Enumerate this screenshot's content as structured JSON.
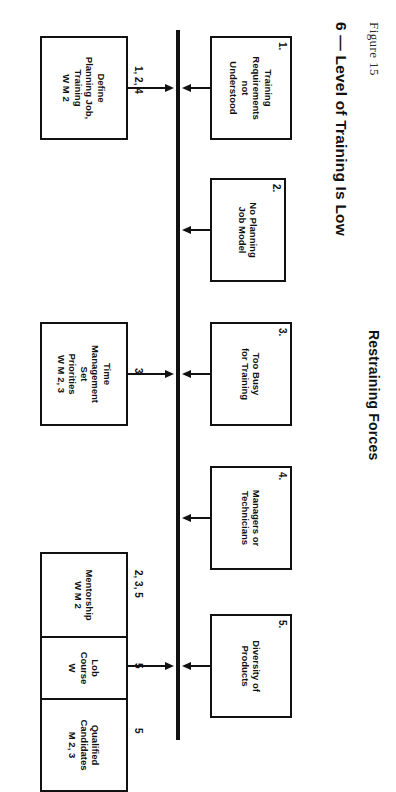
{
  "figure": {
    "label": "Figure 15",
    "section_title": "6 — Level of Training Is Low",
    "group_title": "Restraining Forces"
  },
  "center_line": {
    "color": "#111111"
  },
  "restraining_forces": [
    {
      "number": "1.",
      "text": "Training\nRequirements\nnot\nUnderstood"
    },
    {
      "number": "2.",
      "text": "No Planning\nJob Model"
    },
    {
      "number": "3.",
      "text": "Too Busy\nfor Training"
    },
    {
      "number": "4.",
      "text": "Managers or\nTechnicians"
    },
    {
      "number": "5.",
      "text": "Diversity of\nProducts"
    }
  ],
  "counter_measures": [
    {
      "tag": "1, 2, 4",
      "text": "Define\nPlanning Job,\nTraining\nW M 2"
    },
    {
      "tag": "3",
      "text": "Time\nManagement\nSet\nPriorities\nW M 2, 3"
    },
    {
      "tag": "2, 3, 5",
      "text": "Mentorship\nW M 2"
    },
    {
      "tag": "5",
      "text": "Lob\nCourse\nW"
    },
    {
      "tag": "5",
      "text": "Qualified\nCandidates\nM 2, 3"
    }
  ]
}
